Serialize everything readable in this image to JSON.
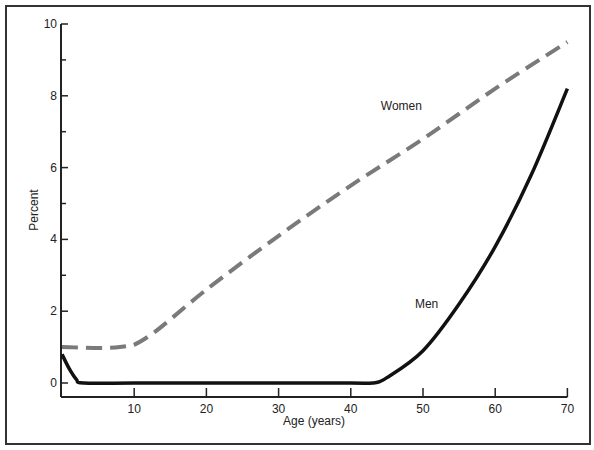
{
  "chart_data": {
    "type": "line",
    "title": "",
    "xlabel": "Age (years)",
    "ylabel": "Percent",
    "xlim": [
      0,
      70
    ],
    "ylim": [
      0,
      10
    ],
    "x_ticks": [
      10,
      20,
      30,
      40,
      50,
      60,
      70
    ],
    "y_ticks": [
      0,
      2,
      4,
      6,
      8,
      10
    ],
    "grid": false,
    "legend": "inline labels",
    "series": [
      {
        "name": "Women",
        "style": "dashed",
        "color": "#7a7a7a",
        "x": [
          0,
          8,
          12,
          20,
          30,
          40,
          50,
          60,
          70
        ],
        "y": [
          1.0,
          1.0,
          1.3,
          2.6,
          4.1,
          5.5,
          6.8,
          8.2,
          9.5
        ]
      },
      {
        "name": "Men",
        "style": "solid",
        "color": "#111111",
        "x": [
          0,
          1,
          2,
          3,
          10,
          20,
          30,
          40,
          43,
          45,
          50,
          55,
          60,
          65,
          70
        ],
        "y": [
          0.8,
          0.4,
          0.1,
          0,
          0,
          0,
          0,
          0,
          0,
          0.15,
          0.9,
          2.2,
          3.8,
          5.8,
          8.2
        ]
      }
    ],
    "annotations": [
      {
        "text": "Women",
        "x": 47,
        "y": 7.6
      },
      {
        "text": "Men",
        "x": 50.5,
        "y": 2.1
      }
    ]
  }
}
